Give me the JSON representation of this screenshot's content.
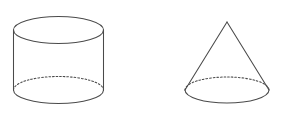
{
  "diagram": {
    "background_color": "#ffffff",
    "stroke_color": "#4a4a4a",
    "hidden_edge_style": "dashed",
    "canvas": {
      "width": 284,
      "height": 118
    },
    "shapes": [
      {
        "id": "cylinder",
        "label": "cylinder",
        "type": "cylinder",
        "center_x": 58.5,
        "radius_x": 45,
        "radius_y": 13.5,
        "top_center_y": 30,
        "bottom_center_y": 90,
        "height": 60,
        "visible_edges": [
          "top-ellipse-full",
          "left-side-line",
          "right-side-line",
          "bottom-front-arc"
        ],
        "hidden_edges": [
          "bottom-back-arc"
        ]
      },
      {
        "id": "cone",
        "label": "cone",
        "type": "cone",
        "center_x": 227,
        "radius_x": 42,
        "radius_y": 13,
        "base_center_y": 90,
        "apex_x": 227,
        "apex_y": 22,
        "height": 68,
        "visible_edges": [
          "left-slant-line",
          "right-slant-line",
          "base-front-arc"
        ],
        "hidden_edges": [
          "base-back-arc"
        ]
      }
    ]
  }
}
